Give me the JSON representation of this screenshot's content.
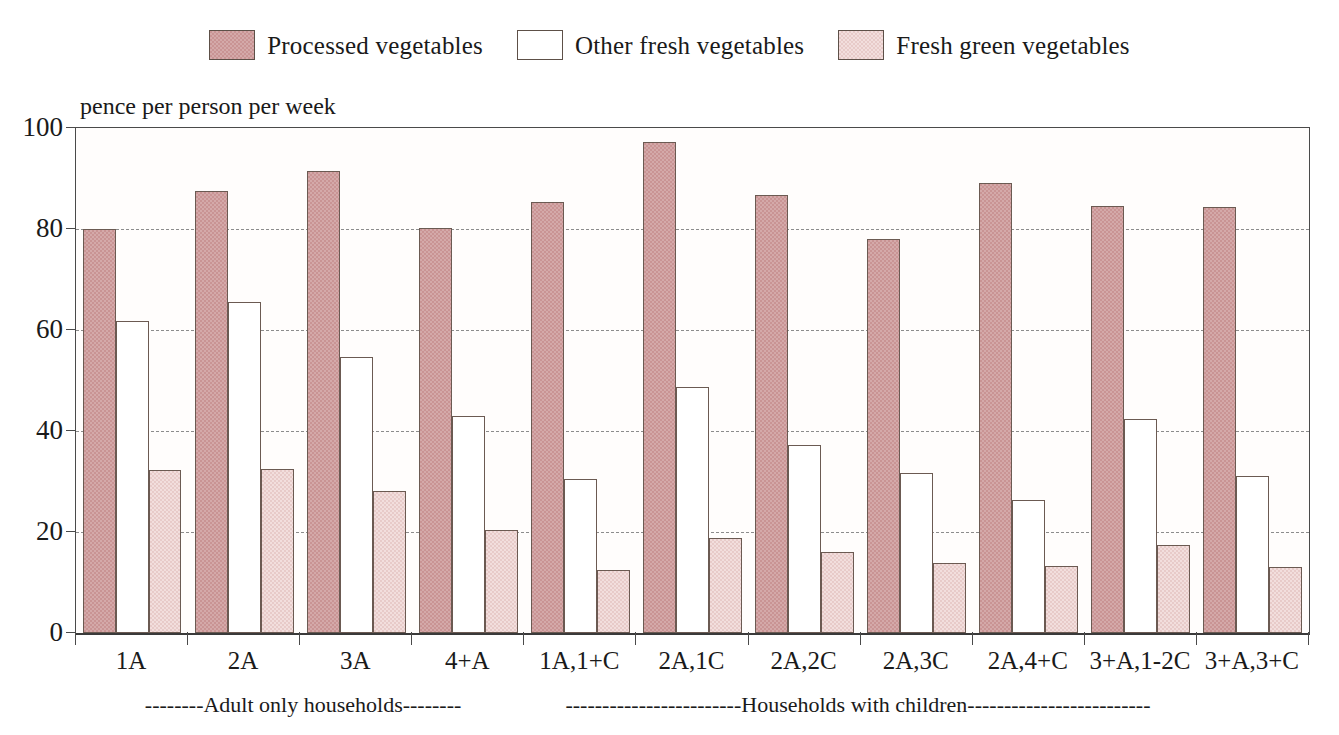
{
  "legend": {
    "items": [
      {
        "label": "Processed vegetables",
        "key": "processed",
        "color": "#c99494",
        "swatch": "legend-swatch-processed"
      },
      {
        "label": "Other fresh vegetables",
        "key": "otherfresh",
        "color": "#ffffff",
        "swatch": "legend-swatch-other-fresh"
      },
      {
        "label": "Fresh green vegetables",
        "key": "freshgreen",
        "color": "#f2dedd",
        "swatch": "legend-swatch-fresh-green"
      }
    ]
  },
  "axis": {
    "y_title": "pence per person per week",
    "y_ticks": [
      "0",
      "20",
      "40",
      "60",
      "80",
      "100"
    ]
  },
  "annotations": [
    {
      "text": "--------Adult only households--------",
      "center_pct": 18.5
    },
    {
      "text": "------------------------Households with children-------------------------",
      "center_pct": 63.5
    }
  ],
  "chart_data": {
    "type": "bar",
    "title": "",
    "subtitle": "",
    "xlabel": "",
    "ylabel": "pence per person per week",
    "ylim": [
      0,
      100
    ],
    "yticks": [
      0,
      20,
      40,
      60,
      80,
      100
    ],
    "grid": true,
    "legend_position": "top-center",
    "categories": [
      "1A",
      "2A",
      "3A",
      "4+A",
      "1A,1+C",
      "2A,1C",
      "2A,2C",
      "2A,3C",
      "2A,4+C",
      "3+A,1-2C",
      "3+A,3+C"
    ],
    "series": [
      {
        "name": "Processed vegetables",
        "color": "#c99494",
        "values": [
          80.0,
          87.5,
          91.5,
          80.2,
          85.4,
          97.2,
          86.7,
          78.0,
          89.2,
          84.6,
          84.4
        ]
      },
      {
        "name": "Other fresh vegetables",
        "color": "#ffffff",
        "values": [
          61.7,
          65.5,
          54.7,
          43.0,
          30.5,
          48.8,
          37.2,
          31.6,
          26.4,
          42.4,
          31.0
        ]
      },
      {
        "name": "Fresh green vegetables",
        "color": "#f2dedd",
        "values": [
          32.2,
          32.5,
          28.1,
          20.4,
          12.4,
          18.8,
          16.0,
          13.8,
          13.3,
          17.4,
          13.1
        ]
      }
    ],
    "group_annotations": [
      {
        "label": "Adult only households",
        "categories": [
          "1A",
          "2A",
          "3A",
          "4+A"
        ]
      },
      {
        "label": "Households with children",
        "categories": [
          "1A,1+C",
          "2A,1C",
          "2A,2C",
          "2A,3C",
          "2A,4+C",
          "3+A,1-2C",
          "3+A,3+C"
        ]
      }
    ]
  }
}
